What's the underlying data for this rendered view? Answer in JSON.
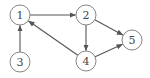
{
  "graph": {
    "type": "directed",
    "nodes": [
      {
        "id": "1",
        "label": "1",
        "x": 20,
        "y": 15
      },
      {
        "id": "2",
        "label": "2",
        "x": 86,
        "y": 15
      },
      {
        "id": "3",
        "label": "3",
        "x": 20,
        "y": 62
      },
      {
        "id": "4",
        "label": "4",
        "x": 86,
        "y": 61
      },
      {
        "id": "5",
        "label": "5",
        "x": 132,
        "y": 40
      }
    ],
    "edges": [
      {
        "from": "1",
        "to": "2"
      },
      {
        "from": "3",
        "to": "1"
      },
      {
        "from": "4",
        "to": "1"
      },
      {
        "from": "2",
        "to": "4"
      },
      {
        "from": "2",
        "to": "5"
      },
      {
        "from": "4",
        "to": "5"
      }
    ],
    "node_radius": 10
  },
  "colors": {
    "stroke": "#555555",
    "node_border": "#777777",
    "text": "#444444",
    "background": "#ffffff"
  }
}
